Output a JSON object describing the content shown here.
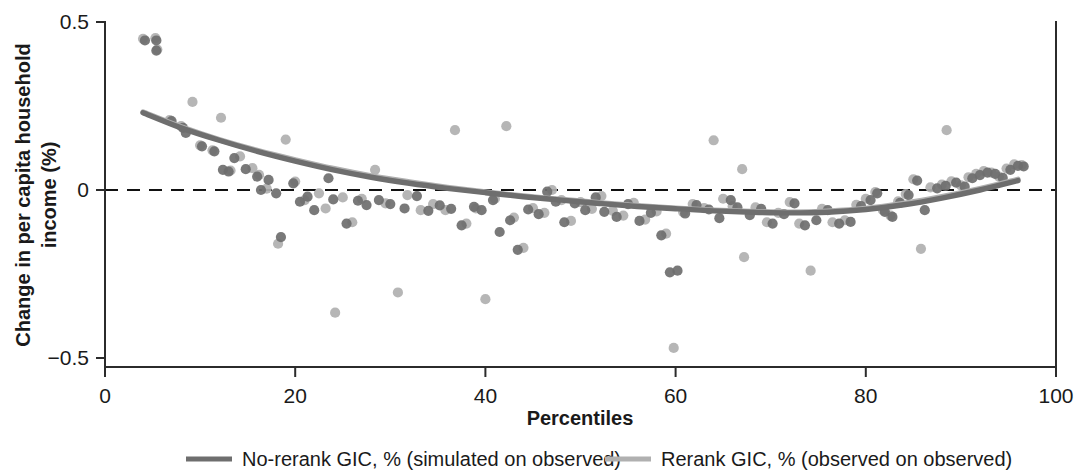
{
  "chart_data": {
    "type": "scatter",
    "title": "",
    "subtitle": "",
    "xlabel": "Percentiles",
    "ylabel_line1": "Change in per capita household",
    "ylabel_line2": "income (%)",
    "xlim": [
      0,
      100
    ],
    "ylim": [
      -0.5,
      0.5
    ],
    "xticks": [
      0,
      20,
      40,
      60,
      80,
      100
    ],
    "xtick_labels": [
      "0",
      "20",
      "40",
      "60",
      "80",
      "100"
    ],
    "yticks": [
      -0.5,
      0,
      0.5
    ],
    "ytick_labels": [
      "−0.5",
      "0",
      "0.5"
    ],
    "grid": false,
    "zero_reference_line": {
      "y": 0,
      "style": "dashed",
      "color": "#111111"
    },
    "legend_position": "below-plot",
    "colors": {
      "no_rerank": "#6e6e6e",
      "rerank": "#b0b0b0",
      "axis": "#2b2b2b",
      "zero_line": "#111111"
    },
    "series": [
      {
        "name": "No-rerank GIC, % (simulated on observed)",
        "color": "#6e6e6e",
        "marker": "circle",
        "has_fit_line": true,
        "fit_line": {
          "x": [
            4,
            8,
            12,
            16,
            20,
            24,
            28,
            32,
            36,
            40,
            44,
            48,
            52,
            56,
            60,
            64,
            68,
            72,
            76,
            80,
            84,
            88,
            92,
            96
          ],
          "y": [
            0.23,
            0.185,
            0.148,
            0.115,
            0.086,
            0.06,
            0.038,
            0.02,
            0.005,
            -0.008,
            -0.02,
            -0.03,
            -0.04,
            -0.049,
            -0.056,
            -0.062,
            -0.066,
            -0.068,
            -0.066,
            -0.058,
            -0.044,
            -0.024,
            0.0,
            0.028
          ]
        },
        "points": [
          {
            "x": 4.2,
            "y": 0.445
          },
          {
            "x": 5.4,
            "y": 0.445
          },
          {
            "x": 5.4,
            "y": 0.415
          },
          {
            "x": 7.0,
            "y": 0.205
          },
          {
            "x": 8.2,
            "y": 0.185
          },
          {
            "x": 8.5,
            "y": 0.17
          },
          {
            "x": 10.2,
            "y": 0.13
          },
          {
            "x": 11.5,
            "y": 0.115
          },
          {
            "x": 12.4,
            "y": 0.06
          },
          {
            "x": 13.0,
            "y": 0.055
          },
          {
            "x": 13.6,
            "y": 0.095
          },
          {
            "x": 14.8,
            "y": 0.062
          },
          {
            "x": 16.0,
            "y": 0.04
          },
          {
            "x": 16.4,
            "y": 0.0
          },
          {
            "x": 17.2,
            "y": 0.03
          },
          {
            "x": 18.0,
            "y": -0.01
          },
          {
            "x": 18.5,
            "y": -0.14
          },
          {
            "x": 19.8,
            "y": 0.02
          },
          {
            "x": 20.5,
            "y": -0.035
          },
          {
            "x": 21.3,
            "y": -0.02
          },
          {
            "x": 22.0,
            "y": -0.06
          },
          {
            "x": 23.5,
            "y": 0.035
          },
          {
            "x": 24.0,
            "y": -0.028
          },
          {
            "x": 25.4,
            "y": -0.1
          },
          {
            "x": 26.6,
            "y": -0.032
          },
          {
            "x": 27.5,
            "y": -0.045
          },
          {
            "x": 28.8,
            "y": -0.03
          },
          {
            "x": 30.0,
            "y": -0.042
          },
          {
            "x": 31.5,
            "y": -0.055
          },
          {
            "x": 32.8,
            "y": -0.018
          },
          {
            "x": 34.0,
            "y": -0.062
          },
          {
            "x": 35.2,
            "y": -0.046
          },
          {
            "x": 36.4,
            "y": -0.056
          },
          {
            "x": 37.5,
            "y": -0.105
          },
          {
            "x": 38.8,
            "y": -0.05
          },
          {
            "x": 39.6,
            "y": -0.06
          },
          {
            "x": 40.8,
            "y": -0.03
          },
          {
            "x": 41.5,
            "y": -0.125
          },
          {
            "x": 42.6,
            "y": -0.09
          },
          {
            "x": 43.4,
            "y": -0.178
          },
          {
            "x": 44.5,
            "y": -0.058
          },
          {
            "x": 45.6,
            "y": -0.072
          },
          {
            "x": 46.5,
            "y": -0.005
          },
          {
            "x": 47.4,
            "y": -0.035
          },
          {
            "x": 48.3,
            "y": -0.096
          },
          {
            "x": 49.4,
            "y": -0.04
          },
          {
            "x": 50.5,
            "y": -0.06
          },
          {
            "x": 51.6,
            "y": -0.022
          },
          {
            "x": 52.5,
            "y": -0.065
          },
          {
            "x": 53.8,
            "y": -0.08
          },
          {
            "x": 55.0,
            "y": -0.042
          },
          {
            "x": 56.2,
            "y": -0.092
          },
          {
            "x": 57.4,
            "y": -0.068
          },
          {
            "x": 58.5,
            "y": -0.135
          },
          {
            "x": 59.4,
            "y": -0.245
          },
          {
            "x": 60.2,
            "y": -0.24
          },
          {
            "x": 61.0,
            "y": -0.07
          },
          {
            "x": 62.2,
            "y": -0.045
          },
          {
            "x": 63.5,
            "y": -0.058
          },
          {
            "x": 64.6,
            "y": -0.084
          },
          {
            "x": 65.8,
            "y": -0.03
          },
          {
            "x": 66.5,
            "y": -0.052
          },
          {
            "x": 67.8,
            "y": -0.075
          },
          {
            "x": 69.0,
            "y": -0.056
          },
          {
            "x": 70.2,
            "y": -0.1
          },
          {
            "x": 71.4,
            "y": -0.072
          },
          {
            "x": 72.5,
            "y": -0.04
          },
          {
            "x": 73.6,
            "y": -0.105
          },
          {
            "x": 74.8,
            "y": -0.09
          },
          {
            "x": 76.0,
            "y": -0.06
          },
          {
            "x": 77.2,
            "y": -0.1
          },
          {
            "x": 78.4,
            "y": -0.095
          },
          {
            "x": 79.5,
            "y": -0.048
          },
          {
            "x": 80.5,
            "y": -0.03
          },
          {
            "x": 81.2,
            "y": -0.01
          },
          {
            "x": 82.0,
            "y": -0.065
          },
          {
            "x": 82.8,
            "y": -0.08
          },
          {
            "x": 83.6,
            "y": -0.038
          },
          {
            "x": 84.5,
            "y": -0.015
          },
          {
            "x": 85.4,
            "y": 0.028
          },
          {
            "x": 86.2,
            "y": -0.06
          },
          {
            "x": 87.5,
            "y": 0.005
          },
          {
            "x": 88.4,
            "y": 0.012
          },
          {
            "x": 89.5,
            "y": 0.022
          },
          {
            "x": 90.4,
            "y": 0.01
          },
          {
            "x": 91.2,
            "y": 0.035
          },
          {
            "x": 92.0,
            "y": 0.044
          },
          {
            "x": 92.8,
            "y": 0.052
          },
          {
            "x": 93.6,
            "y": 0.048
          },
          {
            "x": 94.4,
            "y": 0.036
          },
          {
            "x": 95.2,
            "y": 0.06
          },
          {
            "x": 96.0,
            "y": 0.072
          },
          {
            "x": 96.6,
            "y": 0.07
          }
        ]
      },
      {
        "name": "Rerank GIC, % (observed on observed)",
        "color": "#b0b0b0",
        "marker": "circle",
        "has_fit_line": true,
        "fit_line": {
          "x": [
            4,
            8,
            12,
            16,
            20,
            24,
            28,
            32,
            36,
            40,
            44,
            48,
            52,
            56,
            60,
            64,
            68,
            72,
            76,
            80,
            84,
            88,
            92,
            96
          ],
          "y": [
            0.232,
            0.188,
            0.15,
            0.118,
            0.09,
            0.064,
            0.042,
            0.024,
            0.008,
            -0.006,
            -0.018,
            -0.028,
            -0.038,
            -0.047,
            -0.054,
            -0.06,
            -0.064,
            -0.066,
            -0.063,
            -0.055,
            -0.04,
            -0.02,
            0.004,
            0.032
          ]
        },
        "points": [
          {
            "x": 4.0,
            "y": 0.45
          },
          {
            "x": 5.3,
            "y": 0.452
          },
          {
            "x": 5.5,
            "y": 0.418
          },
          {
            "x": 6.8,
            "y": 0.208
          },
          {
            "x": 8.0,
            "y": 0.19
          },
          {
            "x": 9.2,
            "y": 0.262
          },
          {
            "x": 10.0,
            "y": 0.133
          },
          {
            "x": 11.3,
            "y": 0.118
          },
          {
            "x": 12.2,
            "y": 0.215
          },
          {
            "x": 13.2,
            "y": 0.058
          },
          {
            "x": 14.2,
            "y": 0.1
          },
          {
            "x": 15.5,
            "y": 0.065
          },
          {
            "x": 16.2,
            "y": 0.045
          },
          {
            "x": 17.0,
            "y": 0.004
          },
          {
            "x": 18.2,
            "y": -0.16
          },
          {
            "x": 19.0,
            "y": 0.15
          },
          {
            "x": 20.0,
            "y": 0.025
          },
          {
            "x": 21.0,
            "y": -0.03
          },
          {
            "x": 22.5,
            "y": -0.01
          },
          {
            "x": 23.2,
            "y": -0.055
          },
          {
            "x": 24.2,
            "y": -0.365
          },
          {
            "x": 25.0,
            "y": -0.022
          },
          {
            "x": 26.0,
            "y": -0.096
          },
          {
            "x": 27.0,
            "y": -0.026
          },
          {
            "x": 28.4,
            "y": 0.06
          },
          {
            "x": 29.5,
            "y": -0.04
          },
          {
            "x": 30.8,
            "y": -0.305
          },
          {
            "x": 31.8,
            "y": -0.015
          },
          {
            "x": 33.2,
            "y": -0.06
          },
          {
            "x": 34.5,
            "y": -0.042
          },
          {
            "x": 35.8,
            "y": -0.06
          },
          {
            "x": 36.8,
            "y": 0.178
          },
          {
            "x": 38.0,
            "y": -0.1
          },
          {
            "x": 39.0,
            "y": -0.055
          },
          {
            "x": 40.0,
            "y": -0.325
          },
          {
            "x": 41.0,
            "y": -0.026
          },
          {
            "x": 42.2,
            "y": 0.19
          },
          {
            "x": 43.0,
            "y": -0.082
          },
          {
            "x": 44.0,
            "y": -0.172
          },
          {
            "x": 45.0,
            "y": -0.054
          },
          {
            "x": 46.2,
            "y": -0.068
          },
          {
            "x": 47.0,
            "y": 0.0
          },
          {
            "x": 48.0,
            "y": -0.03
          },
          {
            "x": 49.0,
            "y": -0.092
          },
          {
            "x": 50.0,
            "y": -0.036
          },
          {
            "x": 51.2,
            "y": -0.056
          },
          {
            "x": 52.2,
            "y": -0.018
          },
          {
            "x": 53.4,
            "y": -0.062
          },
          {
            "x": 54.5,
            "y": -0.076
          },
          {
            "x": 55.6,
            "y": -0.038
          },
          {
            "x": 56.8,
            "y": -0.088
          },
          {
            "x": 58.0,
            "y": -0.064
          },
          {
            "x": 59.0,
            "y": -0.13
          },
          {
            "x": 59.8,
            "y": -0.47
          },
          {
            "x": 60.8,
            "y": -0.066
          },
          {
            "x": 61.8,
            "y": -0.042
          },
          {
            "x": 63.0,
            "y": -0.054
          },
          {
            "x": 64.0,
            "y": 0.148
          },
          {
            "x": 65.0,
            "y": -0.026
          },
          {
            "x": 66.0,
            "y": -0.048
          },
          {
            "x": 67.2,
            "y": -0.2
          },
          {
            "x": 68.4,
            "y": -0.052
          },
          {
            "x": 69.6,
            "y": -0.096
          },
          {
            "x": 70.8,
            "y": -0.068
          },
          {
            "x": 72.0,
            "y": -0.036
          },
          {
            "x": 73.0,
            "y": -0.1
          },
          {
            "x": 74.2,
            "y": -0.24
          },
          {
            "x": 75.4,
            "y": -0.056
          },
          {
            "x": 76.5,
            "y": -0.096
          },
          {
            "x": 77.8,
            "y": -0.09
          },
          {
            "x": 79.0,
            "y": -0.044
          },
          {
            "x": 80.0,
            "y": -0.026
          },
          {
            "x": 81.0,
            "y": -0.006
          },
          {
            "x": 81.8,
            "y": -0.06
          },
          {
            "x": 82.6,
            "y": -0.076
          },
          {
            "x": 83.4,
            "y": -0.034
          },
          {
            "x": 84.2,
            "y": -0.012
          },
          {
            "x": 85.0,
            "y": 0.032
          },
          {
            "x": 85.8,
            "y": -0.175
          },
          {
            "x": 86.8,
            "y": 0.008
          },
          {
            "x": 88.0,
            "y": 0.016
          },
          {
            "x": 89.0,
            "y": 0.026
          },
          {
            "x": 90.0,
            "y": 0.014
          },
          {
            "x": 90.8,
            "y": 0.038
          },
          {
            "x": 91.6,
            "y": 0.048
          },
          {
            "x": 92.4,
            "y": 0.056
          },
          {
            "x": 93.2,
            "y": 0.052
          },
          {
            "x": 94.0,
            "y": 0.04
          },
          {
            "x": 94.8,
            "y": 0.064
          },
          {
            "x": 95.6,
            "y": 0.076
          },
          {
            "x": 96.4,
            "y": 0.074
          },
          {
            "x": 88.5,
            "y": 0.178
          },
          {
            "x": 67.0,
            "y": 0.062
          }
        ]
      }
    ]
  },
  "legend": {
    "items": [
      {
        "label": "No-rerank GIC, % (simulated on observed)",
        "color": "#6e6e6e"
      },
      {
        "label": "Rerank GIC, % (observed on observed)",
        "color": "#b0b0b0"
      }
    ]
  }
}
